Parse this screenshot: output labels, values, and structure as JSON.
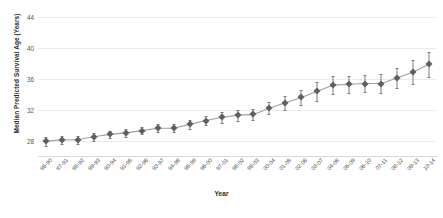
{
  "chart_data": {
    "type": "scatter",
    "title": "",
    "xlabel": "Year",
    "ylabel": "Median Predicted Survival Age (Years)",
    "ylim": [
      26,
      45.2
    ],
    "yticks": [
      28,
      32,
      36,
      40,
      44
    ],
    "grid": true,
    "legend": false,
    "marker_style": "diamond",
    "errorbars": true,
    "trendline": true,
    "categories": [
      "86-90",
      "87-91",
      "88-92",
      "89-93",
      "90-94",
      "91-95",
      "92-96",
      "93-97",
      "94-98",
      "95-99",
      "96-00",
      "97-01",
      "98-02",
      "99-03",
      "00-04",
      "01-05",
      "02-06",
      "03-07",
      "04-08",
      "05-09",
      "06-10",
      "07-11",
      "08-12",
      "09-13",
      "10-14"
    ],
    "values": [
      27.9,
      28.1,
      28.1,
      28.5,
      28.8,
      29.0,
      29.3,
      29.6,
      29.6,
      30.1,
      30.6,
      31.0,
      31.3,
      31.4,
      32.2,
      32.9,
      33.6,
      34.4,
      35.2,
      35.3,
      35.4,
      35.4,
      36.1,
      36.9,
      37.9
    ],
    "error_low": [
      27.3,
      27.6,
      27.6,
      28.0,
      28.3,
      28.5,
      28.8,
      29.1,
      29.1,
      29.5,
      30.0,
      30.3,
      30.6,
      30.7,
      31.4,
      32.0,
      32.6,
      33.2,
      34.0,
      34.2,
      34.3,
      34.2,
      34.8,
      35.4,
      36.3
    ],
    "error_high": [
      28.5,
      28.6,
      28.6,
      29.0,
      29.3,
      29.5,
      29.8,
      30.1,
      30.1,
      30.7,
      31.2,
      31.7,
      32.0,
      32.1,
      33.0,
      33.8,
      34.6,
      35.6,
      36.4,
      36.4,
      36.5,
      36.6,
      37.4,
      38.4,
      39.5
    ],
    "series_name": "Median predicted survival age"
  },
  "colors": {
    "marker": "#5f5f5f",
    "errorbar": "#7c7c7c",
    "trendline": "#9e9e9e",
    "gridline": "#ebebeb",
    "axis_text": "#4a4a4a",
    "title_text": "#2b2b2b",
    "background": "#ffffff"
  },
  "caption": ""
}
